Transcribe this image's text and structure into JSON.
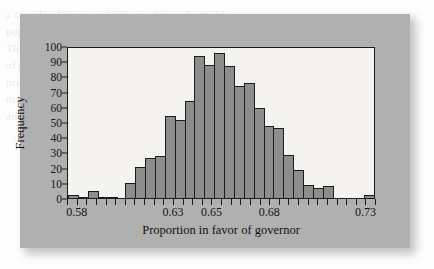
{
  "figure": {
    "panel_background": "#b0b0b0",
    "plot_background": "#f4f3f0",
    "axis_color": "#1c1c1c",
    "bar_fill": "#8d8d8d"
  },
  "ghost_text": "a sample of size n = 1000 was drawn from this\npopulation and the sample proportion recorded.\nThe process was then repeated a large number\nof times. The resulting distribution of sample\nproportions is shown in the histogram. Notice\nthat the distribution is approximately normal\nand centered near the population proportion.",
  "chart_data": {
    "type": "bar",
    "title": "",
    "subtitle": "",
    "xlabel": "Proportion in favor of governor",
    "ylabel": "Frequency",
    "xlim": [
      0.575,
      0.735
    ],
    "ylim": [
      0,
      100
    ],
    "bin_width": 0.005,
    "grid": false,
    "legend": null,
    "x_tick_labels": [
      "0.58",
      "0.63",
      "0.65",
      "0.68",
      "0.73"
    ],
    "x_tick_values": [
      0.58,
      0.63,
      0.65,
      0.68,
      0.73
    ],
    "y_tick_labels": [
      "0",
      "10",
      "20",
      "30",
      "40",
      "50",
      "60",
      "70",
      "80",
      "90",
      "100"
    ],
    "y_tick_values": [
      0,
      10,
      20,
      30,
      40,
      50,
      60,
      70,
      80,
      90,
      100
    ],
    "categories": [
      "0.575",
      "0.580",
      "0.585",
      "0.590",
      "0.595",
      "0.600",
      "0.605",
      "0.610",
      "0.615",
      "0.620",
      "0.625",
      "0.630",
      "0.635",
      "0.640",
      "0.645",
      "0.650",
      "0.655",
      "0.660",
      "0.665",
      "0.670",
      "0.675",
      "0.680",
      "0.685",
      "0.690",
      "0.695",
      "0.700",
      "0.705",
      "0.710",
      "0.715",
      "0.720",
      "0.725",
      "0.730"
    ],
    "values": [
      2,
      1,
      5,
      1,
      1,
      0,
      10,
      21,
      27,
      28,
      55,
      52,
      65,
      95,
      89,
      97,
      88,
      75,
      77,
      60,
      48,
      47,
      29,
      19,
      9,
      7,
      8,
      0,
      0,
      0,
      0,
      2
    ]
  }
}
